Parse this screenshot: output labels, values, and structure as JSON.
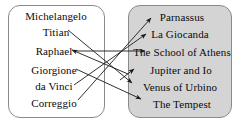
{
  "diagram": {
    "type": "bipartite-mapping",
    "left_group": {
      "name": "artists",
      "fill_color": "#ffffff",
      "border_color": "#8a8a8a",
      "items": [
        {
          "label": "Michelangelo",
          "cx": 56,
          "cy": 16
        },
        {
          "label": "Titian",
          "cx": 56,
          "cy": 32
        },
        {
          "label": "Raphael",
          "cx": 54,
          "cy": 51
        },
        {
          "label": "Giorgione",
          "cx": 54,
          "cy": 70
        },
        {
          "label": "da Vinci",
          "cx": 54,
          "cy": 86
        },
        {
          "label": "Correggio",
          "cx": 54,
          "cy": 103
        }
      ]
    },
    "right_group": {
      "name": "artworks",
      "fill_color": "#d4d4d4",
      "border_color": "#8a8a8a",
      "items": [
        {
          "label": "Parnassus",
          "cx": 182,
          "cy": 17
        },
        {
          "label": "La Giocanda",
          "cx": 180,
          "cy": 34
        },
        {
          "label": "The School of Athens",
          "cx": 182,
          "cy": 52
        },
        {
          "label": "Jupiter and Io",
          "cx": 181,
          "cy": 70
        },
        {
          "label": "Venus of Urbino",
          "cx": 180,
          "cy": 87
        },
        {
          "label": "The Tempest",
          "cx": 182,
          "cy": 104
        }
      ]
    },
    "edges": [
      {
        "from": "Titian",
        "to": "Venus of Urbino",
        "x1": 68,
        "y1": 30,
        "x2": 132,
        "y2": 83,
        "arrow": "end"
      },
      {
        "from": "Raphael",
        "to": "The School of Athens",
        "x1": 75,
        "y1": 51,
        "x2": 145,
        "y2": 51,
        "arrow": "end"
      },
      {
        "from": "Correggio",
        "to": "Parnassus",
        "x1": 78,
        "y1": 100,
        "x2": 151,
        "y2": 18,
        "arrow": "end"
      },
      {
        "from": "Giorgione",
        "to": "The Tempest",
        "x1": 76,
        "y1": 69,
        "x2": 141,
        "y2": 99,
        "arrow": "end"
      },
      {
        "from": "da Vinci",
        "to": "La Giocanda",
        "x1": 74,
        "y1": 85,
        "x2": 146,
        "y2": 34,
        "arrow": "end"
      },
      {
        "from": "Michelangelo",
        "to": "Raphael",
        "x1": 128,
        "y1": 74,
        "x2": 72,
        "y2": 50,
        "arrow": "end"
      },
      {
        "from": "unlabeled",
        "to": "Jupiter and Io",
        "x1": 120,
        "y1": 80,
        "x2": 134,
        "y2": 69,
        "arrow": "end"
      }
    ],
    "line_color": "#1a1a1a"
  }
}
